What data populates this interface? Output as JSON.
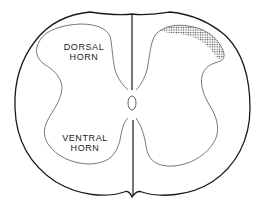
{
  "diagram": {
    "labels": {
      "dorsal_horn": [
        "DORSAL",
        "HORN"
      ],
      "ventral_horn": [
        "VENTRAL",
        "HORN"
      ]
    },
    "colors": {
      "outline": "#1a1a1a",
      "gray_matter_outline": "#444444",
      "shading": "#555555",
      "background": "#ffffff"
    }
  }
}
